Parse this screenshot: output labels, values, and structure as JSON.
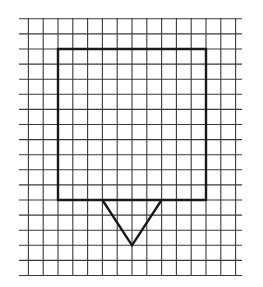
{
  "diagram": {
    "background": "#ffffff",
    "grid": {
      "columns": 15,
      "rows": 18,
      "origin_x": 28.4,
      "origin_y": 18.8,
      "cell_w": 14.8,
      "cell_h": 15.1,
      "h_line_x_start": 19,
      "h_line_x_end": 242,
      "v_line_y_start": 18,
      "v_line_y_end": 276,
      "line_color": "#3a3a3a",
      "line_width": 1.1
    },
    "shapes": [
      {
        "name": "square",
        "type": "polygon",
        "points_grid": [
          [
            2,
            2
          ],
          [
            12,
            2
          ],
          [
            12,
            12
          ],
          [
            2,
            12
          ]
        ],
        "stroke": "#1a1a1a",
        "stroke_width": 2.4
      },
      {
        "name": "triangle",
        "type": "polyline",
        "points_grid": [
          [
            5,
            12
          ],
          [
            7,
            15
          ],
          [
            9,
            12
          ]
        ],
        "stroke": "#1a1a1a",
        "stroke_width": 2.4
      }
    ]
  }
}
